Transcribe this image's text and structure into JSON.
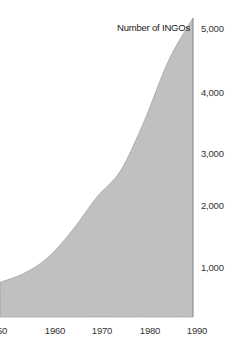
{
  "chart_data": {
    "type": "area",
    "title": "Number of INGOs",
    "xlabel": "",
    "ylabel": "Number of INGOs",
    "x": [
      1950,
      1955,
      1960,
      1965,
      1970,
      1975,
      1980,
      1985,
      1990
    ],
    "series": [
      {
        "name": "Number of INGOs",
        "values": [
          580,
          730,
          1000,
          1450,
          2000,
          2450,
          3300,
          4300,
          5000
        ]
      }
    ],
    "x_ticks": [
      "1950",
      "1960",
      "1970",
      "1980",
      "1990"
    ],
    "y_ticks": [
      "1,000",
      "2,000",
      "3,000",
      "4,000",
      "5,000"
    ],
    "xlim": [
      1950,
      1990
    ],
    "ylim": [
      0,
      5000
    ],
    "grid": false,
    "legend": "none",
    "fill_color": "#c4c4c4"
  },
  "labels": {
    "title": "Number of INGOs",
    "y": [
      "5,000",
      "4,000",
      "3,000",
      "2,000",
      "1,000"
    ],
    "x": [
      "50",
      "1960",
      "1970",
      "1980",
      "1990"
    ]
  }
}
